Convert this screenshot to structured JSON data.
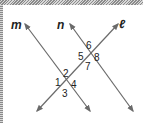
{
  "diagram": {
    "lines": [
      {
        "name": "m",
        "label": "m"
      },
      {
        "name": "n",
        "label": "n"
      },
      {
        "name": "l",
        "label": "ℓ"
      }
    ],
    "angles": [
      "1",
      "2",
      "3",
      "4",
      "5",
      "6",
      "7",
      "8"
    ],
    "line_color": "#6a6a6a"
  }
}
